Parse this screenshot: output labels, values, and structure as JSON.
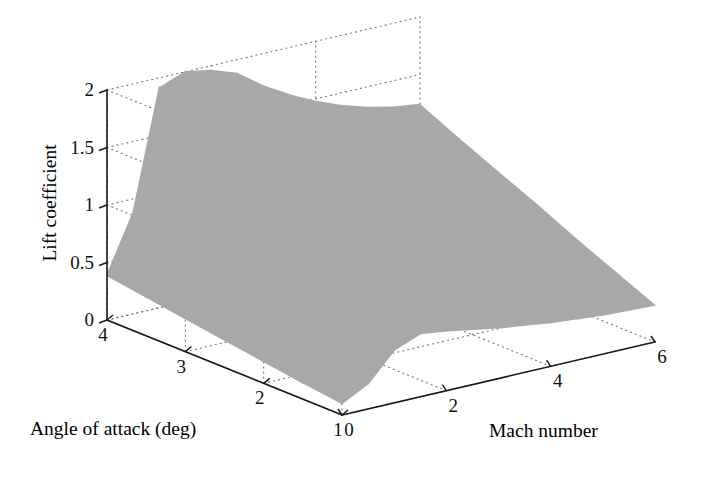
{
  "figure": {
    "type": "3d-surface-plot",
    "background_color": "#ffffff",
    "surface_color": "#a8a8a8",
    "axis_color": "#1a1a1a",
    "grid_color": "#7a7a7a"
  },
  "axes": {
    "x": {
      "name": "mach-number-axis",
      "title": "Mach number",
      "ticks": [
        0,
        2,
        4,
        6
      ],
      "tick_labels": [
        "0",
        "2",
        "4",
        "6"
      ],
      "range": [
        0,
        6
      ]
    },
    "y": {
      "name": "angle-of-attack-axis",
      "title": "Angle of attack (deg)",
      "ticks": [
        4,
        3,
        2,
        1
      ],
      "tick_labels": [
        "4",
        "3",
        "2",
        "1"
      ],
      "range": [
        1,
        4
      ]
    },
    "z": {
      "name": "lift-coefficient-axis",
      "title": "Lift coefficient",
      "ticks": [
        0,
        0.5,
        1,
        1.5,
        2
      ],
      "tick_labels": [
        "0",
        "0.5",
        "1",
        "1.5",
        "2"
      ],
      "range": [
        0,
        2
      ]
    }
  },
  "chart_data": {
    "type": "surface",
    "title": "",
    "xlabel": "Mach number",
    "ylabel": "Angle of attack (deg)",
    "zlabel": "Lift coefficient",
    "xlim": [
      0,
      6
    ],
    "ylim": [
      1,
      4
    ],
    "zlim": [
      0,
      2
    ],
    "xticks": [
      0,
      2,
      4,
      6
    ],
    "yticks": [
      1,
      2,
      3,
      4
    ],
    "zticks": [
      0,
      0.5,
      1,
      1.5,
      2
    ],
    "grid": true,
    "legend": "none",
    "x": [
      0,
      0.5,
      1,
      1.5,
      2,
      2.5,
      3,
      3.5,
      4,
      4.5,
      5,
      5.5,
      6
    ],
    "y": [
      1,
      1.5,
      2,
      2.5,
      3,
      3.5,
      4
    ],
    "z": [
      [
        0.1,
        0.22,
        0.46,
        0.55,
        0.52,
        0.48,
        0.44,
        0.41,
        0.38,
        0.36,
        0.34,
        0.33,
        0.32
      ],
      [
        0.14,
        0.33,
        0.7,
        0.82,
        0.77,
        0.71,
        0.65,
        0.6,
        0.56,
        0.53,
        0.5,
        0.48,
        0.47
      ],
      [
        0.19,
        0.44,
        0.95,
        1.1,
        1.03,
        0.94,
        0.86,
        0.8,
        0.74,
        0.7,
        0.66,
        0.64,
        0.62
      ],
      [
        0.24,
        0.55,
        1.19,
        1.38,
        1.29,
        1.18,
        1.08,
        1.0,
        0.93,
        0.87,
        0.83,
        0.8,
        0.78
      ],
      [
        0.29,
        0.66,
        1.43,
        1.66,
        1.55,
        1.41,
        1.29,
        1.19,
        1.11,
        1.04,
        0.99,
        0.95,
        0.93
      ],
      [
        0.34,
        0.77,
        1.67,
        1.93,
        1.8,
        1.64,
        1.5,
        1.39,
        1.29,
        1.21,
        1.15,
        1.11,
        1.08
      ],
      [
        0.39,
        0.88,
        1.91,
        2.0,
        1.96,
        1.88,
        1.72,
        1.59,
        1.48,
        1.39,
        1.32,
        1.27,
        1.24
      ]
    ]
  },
  "projection": {
    "origin_corner": {
      "x": 107,
      "y": 320,
      "label": "z0-aoa4"
    },
    "front_corner": {
      "x": 342,
      "y": 415,
      "label": "aoa1-mach0"
    },
    "right_corner": {
      "x": 655,
      "y": 342,
      "label": "mach6"
    },
    "back_corner": {
      "x": 412,
      "y": 248,
      "label": "back-floor"
    },
    "z_top": {
      "x": 107,
      "y": 90
    }
  }
}
